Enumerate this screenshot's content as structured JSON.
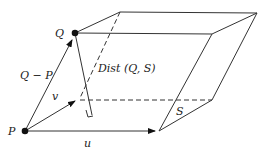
{
  "diagram": {
    "labels": {
      "Q": "Q",
      "P": "P",
      "q_minus_p": "Q − P",
      "v": "v",
      "u": "u",
      "dist": "Dist (Q, S)",
      "S": "S"
    },
    "colors": {
      "line": "#222222",
      "background": "#ffffff"
    }
  }
}
